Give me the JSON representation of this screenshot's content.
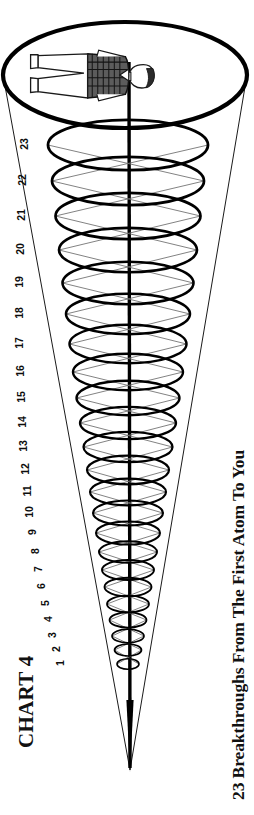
{
  "document": {
    "title": "CHART 4",
    "caption": "23 Breakthroughs From The First Atom To You",
    "orientation": "rotated-90-ccw",
    "background_color": "#ffffff",
    "ink_color": "#000000"
  },
  "chart_data": {
    "type": "diagram",
    "title": "CHART 4",
    "subtitle": "23 Breakthroughs From The First Atom To You",
    "xlabel": "",
    "ylabel": "Breakthrough number",
    "categories": [
      "1",
      "2",
      "3",
      "4",
      "5",
      "6",
      "7",
      "8",
      "9",
      "10",
      "11",
      "12",
      "13",
      "14",
      "15",
      "16",
      "17",
      "18",
      "19",
      "20",
      "21",
      "22",
      "23"
    ],
    "rings": [
      {
        "label": "1",
        "y": 664,
        "rx": 11,
        "ry": 5.2
      },
      {
        "label": "2",
        "y": 650,
        "rx": 13.5,
        "ry": 6.0
      },
      {
        "label": "3",
        "y": 636,
        "rx": 16,
        "ry": 6.8
      },
      {
        "label": "4",
        "y": 620,
        "rx": 18.5,
        "ry": 7.6
      },
      {
        "label": "5",
        "y": 604,
        "rx": 21,
        "ry": 8.4
      },
      {
        "label": "6",
        "y": 587,
        "rx": 23.5,
        "ry": 9.2
      },
      {
        "label": "7",
        "y": 570,
        "rx": 26,
        "ry": 10.0
      },
      {
        "label": "8",
        "y": 552,
        "rx": 29,
        "ry": 10.8
      },
      {
        "label": "9",
        "y": 533,
        "rx": 32,
        "ry": 11.6
      },
      {
        "label": "10",
        "y": 513,
        "rx": 35,
        "ry": 12.5
      },
      {
        "label": "11",
        "y": 492,
        "rx": 38,
        "ry": 13.4
      },
      {
        "label": "12",
        "y": 470,
        "rx": 41,
        "ry": 14.3
      },
      {
        "label": "13",
        "y": 447,
        "rx": 44.5,
        "ry": 15.2
      },
      {
        "label": "14",
        "y": 423,
        "rx": 48,
        "ry": 16.2
      },
      {
        "label": "15",
        "y": 398,
        "rx": 51.5,
        "ry": 17.2
      },
      {
        "label": "16",
        "y": 372,
        "rx": 55,
        "ry": 18.2
      },
      {
        "label": "17",
        "y": 344,
        "rx": 58.5,
        "ry": 19.2
      },
      {
        "label": "18",
        "y": 314,
        "rx": 62,
        "ry": 20.2
      },
      {
        "label": "19",
        "y": 283,
        "rx": 65.5,
        "ry": 21.2
      },
      {
        "label": "20",
        "y": 250,
        "rx": 69,
        "ry": 22.2
      },
      {
        "label": "21",
        "y": 216,
        "rx": 72.5,
        "ry": 23.2
      },
      {
        "label": "22",
        "y": 181,
        "rx": 76,
        "ry": 24.2
      },
      {
        "label": "23",
        "y": 145,
        "rx": 80,
        "ry": 25.2
      }
    ],
    "number_labels": [
      {
        "label": "1",
        "x": 60,
        "y": 664
      },
      {
        "label": "2",
        "x": 56,
        "y": 650
      },
      {
        "label": "3",
        "x": 52,
        "y": 636
      },
      {
        "label": "4",
        "x": 48,
        "y": 620
      },
      {
        "label": "5",
        "x": 45,
        "y": 604
      },
      {
        "label": "6",
        "x": 41,
        "y": 587
      },
      {
        "label": "7",
        "x": 38,
        "y": 570
      },
      {
        "label": "8",
        "x": 35,
        "y": 552
      },
      {
        "label": "9",
        "x": 32,
        "y": 533
      },
      {
        "label": "10",
        "x": 29,
        "y": 513
      },
      {
        "label": "11",
        "x": 27,
        "y": 492
      },
      {
        "label": "12",
        "x": 25,
        "y": 470
      },
      {
        "label": "13",
        "x": 23,
        "y": 447
      },
      {
        "label": "14",
        "x": 22,
        "y": 423
      },
      {
        "label": "15",
        "x": 21,
        "y": 398
      },
      {
        "label": "16",
        "x": 20,
        "y": 372
      },
      {
        "label": "17",
        "x": 19,
        "y": 344
      },
      {
        "label": "18",
        "x": 19,
        "y": 314
      },
      {
        "label": "19",
        "x": 19,
        "y": 283
      },
      {
        "label": "20",
        "x": 20,
        "y": 250
      },
      {
        "label": "21",
        "x": 21,
        "y": 216
      },
      {
        "label": "22",
        "x": 22,
        "y": 181
      },
      {
        "label": "23",
        "x": 24,
        "y": 145
      }
    ],
    "cone": {
      "apex": {
        "x": 130,
        "y": 770
      },
      "mouth_center": {
        "x": 125,
        "y": 75
      },
      "mouth_rx": 122,
      "mouth_ry": 53
    },
    "figure": {
      "name": "human-figure",
      "description": "standing person in patterned/shaded jacket, arms at sides, shown sideways",
      "position": {
        "x": 95,
        "y": 75
      }
    }
  }
}
